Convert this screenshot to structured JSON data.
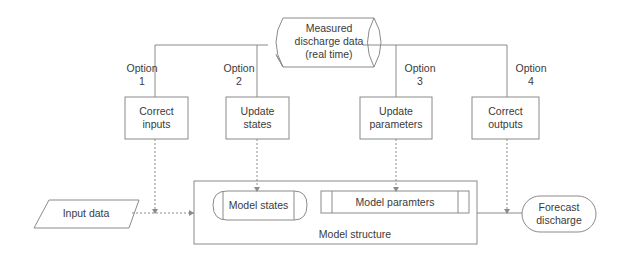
{
  "source": {
    "label": "Measured\ndischarge data\n(real time)",
    "shape": "horizontal-cylinder"
  },
  "options": [
    {
      "option_label": "Option\n1",
      "action_label": "Correct\ninputs"
    },
    {
      "option_label": "Option\n2",
      "action_label": "Update\nstates"
    },
    {
      "option_label": "Option\n3",
      "action_label": "Update\nparameters"
    },
    {
      "option_label": "Option\n4",
      "action_label": "Correct\noutputs"
    }
  ],
  "input": {
    "label": "Input data",
    "shape": "parallelogram"
  },
  "model": {
    "container_label": "Model structure",
    "states_label": "Model states",
    "parameters_label": "Model paramters"
  },
  "output": {
    "label": "Forecast\ndischarge",
    "shape": "terminator"
  },
  "colors": {
    "line": "#8a8a8a",
    "text": "#3a3a3a",
    "background": "#ffffff"
  }
}
